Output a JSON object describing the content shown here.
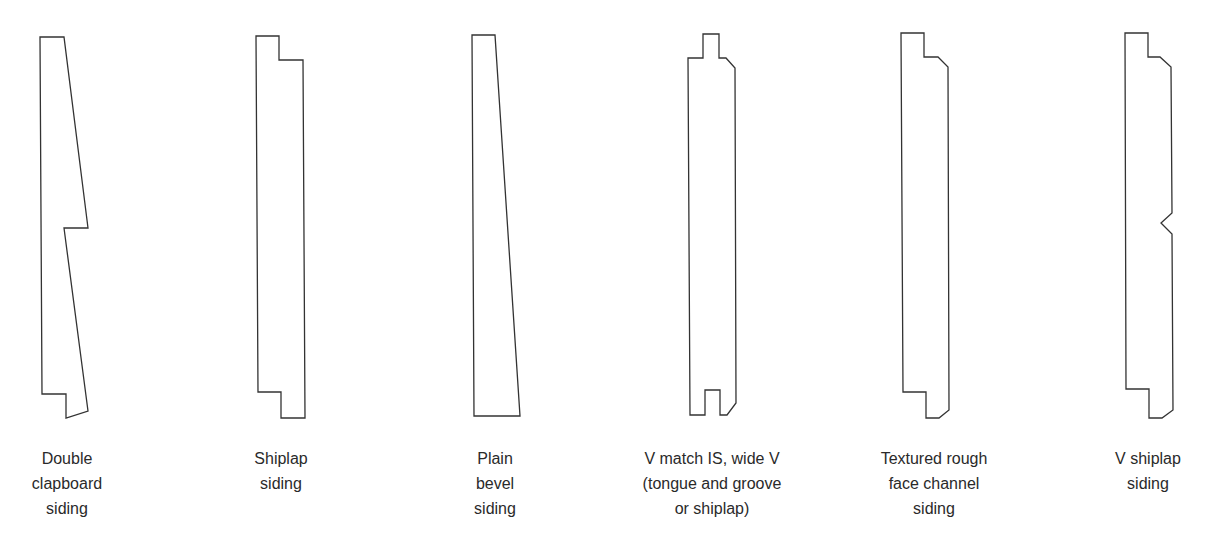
{
  "diagram": {
    "stroke_color": "#333333",
    "profiles": [
      {
        "id": "double-clapboard",
        "label_lines": [
          "Double",
          "clapboard",
          "siding"
        ],
        "label_center_x": 67,
        "points": "40,37 64,37 88,228 64,228 88,411 66,418 66,394 42,394"
      },
      {
        "id": "shiplap",
        "label_lines": [
          "Shiplap",
          "siding"
        ],
        "label_center_x": 281,
        "points": "256,36 279,36 279,60 303,60 305,418 281,418 281,392 258,392"
      },
      {
        "id": "plain-bevel",
        "label_lines": [
          "Plain",
          "bevel",
          "siding"
        ],
        "label_center_x": 495,
        "points": "472,35 495,35 520,416 474,416"
      },
      {
        "id": "v-match-wide-v",
        "label_lines": [
          "V match IS, wide V",
          "(tongue and groove",
          "or shiplap)"
        ],
        "label_center_x": 712,
        "points": "703,34 719,34 719,58 726,58 735,68 736,403 727,415 720,415 720,390 705,390 705,415 690,415 688,58 703,58"
      },
      {
        "id": "textured-rough-face-channel",
        "label_lines": [
          "Textured rough",
          "face channel",
          "siding"
        ],
        "label_center_x": 934,
        "points": "901,33 924,33 924,57 938,57 948,67 949,410 939,418 926,418 926,392 903,392"
      },
      {
        "id": "v-shiplap",
        "label_lines": [
          "V shiplap",
          "siding"
        ],
        "label_center_x": 1148,
        "points": "1125,33 1148,33 1148,57 1160,57 1171,67 1172,213 1161,223 1172,234 1173,410 1162,418 1149,418 1149,389 1126,389"
      }
    ]
  }
}
